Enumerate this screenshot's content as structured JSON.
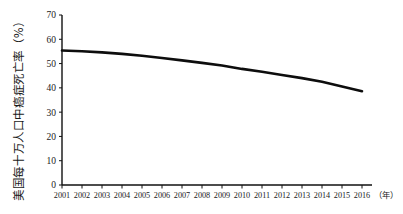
{
  "chart_data": {
    "type": "line",
    "title": "",
    "subtitle": "",
    "xlabel": "（年）",
    "ylabel": "美国每十万人口中癌症死亡率（%）",
    "xlim": [
      2001,
      2016
    ],
    "ylim": [
      0,
      70
    ],
    "grid": false,
    "legend": "none",
    "y_ticks": [
      0,
      10,
      20,
      30,
      40,
      50,
      60,
      70
    ],
    "y_tick_labels": [
      "0",
      "10",
      "20",
      "30",
      "40",
      "50",
      "60",
      "70"
    ],
    "categories": [
      2001,
      2002,
      2003,
      2004,
      2005,
      2006,
      2007,
      2008,
      2009,
      2010,
      2011,
      2012,
      2013,
      2014,
      2015,
      2016
    ],
    "x_tick_labels": [
      "2001",
      "2002",
      "2003",
      "2004",
      "2005",
      "2006",
      "2007",
      "2008",
      "2009",
      "2010",
      "2011",
      "2012",
      "2013",
      "2014",
      "2015",
      "2016"
    ],
    "series": [
      {
        "name": "美国每十万人口中癌症死亡率",
        "values": [
          55.4,
          55.1,
          54.6,
          54.0,
          53.2,
          52.3,
          51.3,
          50.3,
          49.2,
          47.8,
          46.6,
          45.3,
          44.0,
          42.5,
          40.6,
          38.6
        ]
      }
    ],
    "annotations": []
  },
  "axes": {
    "y_axis_title": "美国每十万人口中癌症死亡率（%）",
    "x_axis_unit": "（年）"
  },
  "colors": {
    "background": "#ffffff",
    "axis": "#111111",
    "series_line": "#0d0d0d",
    "text": "#1a1a1a"
  }
}
